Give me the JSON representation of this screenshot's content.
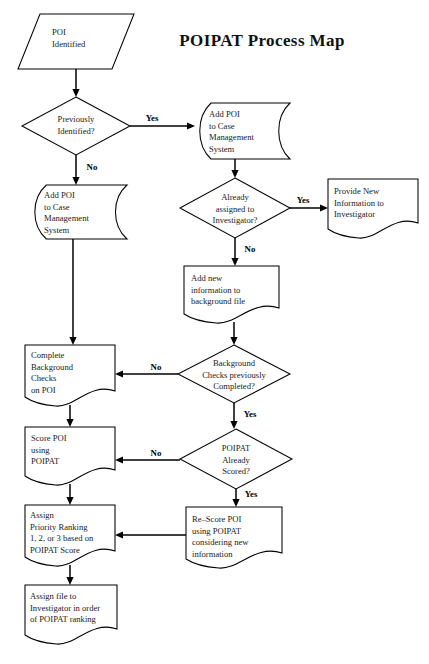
{
  "document": {
    "title": "POIPAT Process Map",
    "type": "flowchart",
    "background_color": "#ffffff",
    "line_color": "#000000",
    "text_color": "#1a1a1a"
  },
  "title": {
    "text": "POIPAT Process Map",
    "x": 262,
    "y": 46
  },
  "nodes": [
    {
      "id": "poi-identified",
      "shape": "parallelogram",
      "lines": [
        "POI",
        "Identified"
      ],
      "text_align": "left",
      "x": 18,
      "y": 14,
      "w": 116,
      "h": 55,
      "skew": 22,
      "text_x": 52,
      "text_y": 33
    },
    {
      "id": "previously-identified",
      "shape": "diamond",
      "lines": [
        "Previously",
        "Identified?"
      ],
      "text_align": "center",
      "x": 22,
      "y": 97,
      "w": 108,
      "h": 58,
      "text_x": 76,
      "text_y": 120
    },
    {
      "id": "add-poi-right",
      "shape": "stored-data",
      "lines": [
        "Add POI",
        "to Case",
        "Management",
        "System"
      ],
      "text_align": "left",
      "x": 196,
      "y": 103,
      "w": 94,
      "h": 56,
      "text_x": 209,
      "text_y": 115
    },
    {
      "id": "add-poi-left",
      "shape": "stored-data",
      "lines": [
        "Add POI",
        "to Case",
        "Management",
        "System"
      ],
      "text_align": "left",
      "x": 31,
      "y": 185,
      "w": 96,
      "h": 54,
      "text_x": 44,
      "text_y": 196
    },
    {
      "id": "already-assigned",
      "shape": "diamond",
      "lines": [
        "Already",
        "assigned to",
        "Investigator?"
      ],
      "text_align": "center",
      "x": 180,
      "y": 178,
      "w": 110,
      "h": 60,
      "text_x": 235,
      "text_y": 198
    },
    {
      "id": "provide-new-info",
      "shape": "document",
      "lines": [
        "Provide New",
        "Information to",
        "Investigator"
      ],
      "text_align": "left",
      "x": 328,
      "y": 179,
      "w": 90,
      "h": 58,
      "text_x": 334,
      "text_y": 192
    },
    {
      "id": "add-new-info",
      "shape": "document",
      "lines": [
        "Add new",
        "information to",
        "background file"
      ],
      "text_align": "left",
      "x": 184,
      "y": 266,
      "w": 95,
      "h": 56,
      "text_x": 191,
      "text_y": 279
    },
    {
      "id": "background-checks-done",
      "shape": "diamond",
      "lines": [
        "Background",
        "Checks previously",
        "Completed?"
      ],
      "text_align": "center",
      "x": 178,
      "y": 345,
      "w": 112,
      "h": 58,
      "text_x": 234,
      "text_y": 364
    },
    {
      "id": "complete-background-checks",
      "shape": "document",
      "lines": [
        "Complete",
        "Background",
        "Checks",
        "on POI"
      ],
      "text_align": "left",
      "x": 25,
      "y": 345,
      "w": 90,
      "h": 60,
      "text_x": 31,
      "text_y": 356
    },
    {
      "id": "poipat-already-scored",
      "shape": "diamond",
      "lines": [
        "POIPAT",
        "Already",
        "Scored?"
      ],
      "text_align": "center",
      "x": 180,
      "y": 429,
      "w": 112,
      "h": 60,
      "text_x": 236,
      "text_y": 449
    },
    {
      "id": "score-poi",
      "shape": "document",
      "lines": [
        "Score POI",
        "using",
        "POIPAT"
      ],
      "text_align": "left",
      "x": 25,
      "y": 427,
      "w": 90,
      "h": 57,
      "text_x": 31,
      "text_y": 439
    },
    {
      "id": "re-score-poi",
      "shape": "document",
      "lines": [
        "Re–Score POI",
        "using POIPAT",
        "considering new",
        "information"
      ],
      "text_align": "left",
      "x": 186,
      "y": 507,
      "w": 96,
      "h": 60,
      "text_x": 192,
      "text_y": 520
    },
    {
      "id": "assign-priority-ranking",
      "shape": "document",
      "lines": [
        "Assign",
        "Priority Ranking",
        "1, 2, or 3 based on",
        "POIPAT Score"
      ],
      "text_align": "left",
      "x": 25,
      "y": 505,
      "w": 90,
      "h": 60,
      "text_x": 30,
      "text_y": 516
    },
    {
      "id": "assign-file",
      "shape": "document",
      "lines": [
        "Assign file to",
        "Investigator in order",
        "of POIPAT ranking"
      ],
      "text_align": "left",
      "x": 25,
      "y": 585,
      "w": 92,
      "h": 58,
      "text_x": 30,
      "text_y": 597
    }
  ],
  "edges": [
    {
      "id": "poi-to-decision1",
      "from": "poi-identified",
      "to": "previously-identified",
      "label": "",
      "path": "M 76 69 L 76 95",
      "arrow_at": [
        76,
        97
      ]
    },
    {
      "id": "decision1-yes",
      "from": "previously-identified",
      "to": "add-poi-right",
      "label": "Yes",
      "label_x": 152,
      "label_y": 119,
      "path": "M 130 126 L 192 126",
      "arrow_at": [
        195,
        126
      ]
    },
    {
      "id": "decision1-no",
      "from": "previously-identified",
      "to": "add-poi-left",
      "label": "No",
      "label_x": 92,
      "label_y": 168,
      "path": "M 76 155 L 76 182",
      "arrow_at": [
        76,
        185
      ]
    },
    {
      "id": "addpoi-right-to-assigned",
      "from": "add-poi-right",
      "to": "already-assigned",
      "label": "",
      "path": "M 235 159 L 235 175",
      "arrow_at": [
        235,
        178
      ]
    },
    {
      "id": "assigned-yes",
      "from": "already-assigned",
      "to": "provide-new-info",
      "label": "Yes",
      "label_x": 303,
      "label_y": 201,
      "path": "M 290 208 L 324 208",
      "arrow_at": [
        328,
        208
      ]
    },
    {
      "id": "assigned-no",
      "from": "already-assigned",
      "to": "add-new-info",
      "label": "No",
      "label_x": 250,
      "label_y": 250,
      "path": "M 235 238 L 235 263",
      "arrow_at": [
        235,
        266
      ]
    },
    {
      "id": "addnew-to-bgcheck",
      "from": "add-new-info",
      "to": "background-checks-done",
      "label": "",
      "path": "M 234 322 L 234 342",
      "arrow_at": [
        234,
        345
      ]
    },
    {
      "id": "bgcheck-no",
      "from": "background-checks-done",
      "to": "complete-background-checks",
      "label": "No",
      "label_x": 156,
      "label_y": 368,
      "path": "M 178 374 L 119 374",
      "arrow_at": [
        115,
        374
      ]
    },
    {
      "id": "bgcheck-yes",
      "from": "background-checks-done",
      "to": "poipat-already-scored",
      "label": "Yes",
      "label_x": 250,
      "label_y": 415,
      "path": "M 234 403 L 234 426",
      "arrow_at": [
        234,
        429
      ]
    },
    {
      "id": "addpoi-left-to-bgchecks",
      "from": "add-poi-left",
      "to": "complete-background-checks",
      "label": "",
      "path": "M 73 239 L 73 342",
      "arrow_at": [
        73,
        345
      ]
    },
    {
      "id": "complete-to-score",
      "from": "complete-background-checks",
      "to": "score-poi",
      "label": "",
      "path": "M 70 405 L 70 424",
      "arrow_at": [
        70,
        427
      ]
    },
    {
      "id": "scored-no",
      "from": "poipat-already-scored",
      "to": "score-poi",
      "label": "No",
      "label_x": 156,
      "label_y": 454,
      "path": "M 180 460 L 119 460",
      "arrow_at": [
        115,
        460
      ]
    },
    {
      "id": "scored-yes",
      "from": "poipat-already-scored",
      "to": "re-score-poi",
      "label": "Yes",
      "label_x": 251,
      "label_y": 495,
      "path": "M 236 489 L 236 504",
      "arrow_at": [
        236,
        507
      ]
    },
    {
      "id": "score-to-assign",
      "from": "score-poi",
      "to": "assign-priority-ranking",
      "label": "",
      "path": "M 70 484 L 70 502",
      "arrow_at": [
        70,
        505
      ]
    },
    {
      "id": "rescore-to-assign",
      "from": "re-score-poi",
      "to": "assign-priority-ranking",
      "label": "",
      "path": "M 186 535 L 119 535",
      "arrow_at": [
        115,
        535
      ]
    },
    {
      "id": "assign-to-file",
      "from": "assign-priority-ranking",
      "to": "assign-file",
      "label": "",
      "path": "M 70 565 L 70 582",
      "arrow_at": [
        70,
        585
      ]
    }
  ]
}
